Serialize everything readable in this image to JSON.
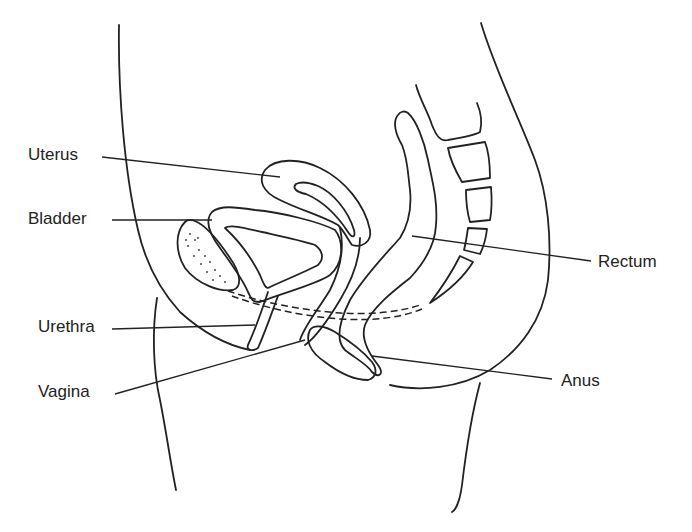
{
  "diagram": {
    "type": "anatomical-cross-section",
    "line_color": "#222222",
    "background": "#ffffff",
    "labels": [
      {
        "id": "uterus",
        "text": "Uterus",
        "x": 28,
        "y": 146
      },
      {
        "id": "bladder",
        "text": "Bladder",
        "x": 28,
        "y": 210
      },
      {
        "id": "urethra",
        "text": "Urethra",
        "x": 38,
        "y": 318
      },
      {
        "id": "vagina",
        "text": "Vagina",
        "x": 38,
        "y": 383
      },
      {
        "id": "rectum",
        "text": "Rectum",
        "x": 598,
        "y": 253
      },
      {
        "id": "anus",
        "text": "Anus",
        "x": 561,
        "y": 372
      }
    ]
  }
}
